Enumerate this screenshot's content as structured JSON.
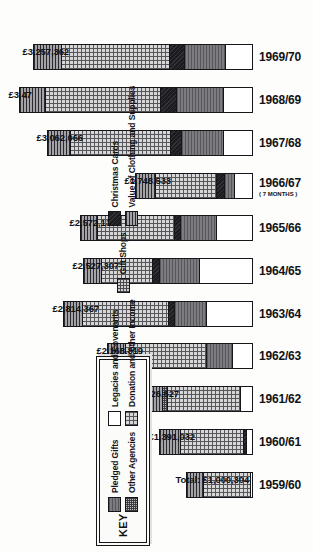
{
  "chart_data": {
    "type": "bar",
    "title": "",
    "xlabel": "",
    "ylabel": "",
    "stacked": true,
    "orientation": "vertical-rotated-90ccw",
    "ylim": [
      0,
      3500000
    ],
    "grid": false,
    "legend_position": "left",
    "categories": [
      "1959/60",
      "1960/61",
      "1961/62",
      "1962/63",
      "1963/64",
      "1964/65",
      "1965/66",
      "1966/67",
      "1967/68",
      "1968/69",
      "1969/70"
    ],
    "total_labels": [
      "Total: £1,000,304",
      "£1,391,032",
      "£1,626,627",
      "£2,168,819",
      "£2,814,367",
      "£2,527,307",
      "£2,572,132",
      "£1,748,533",
      "£3,062,066",
      "£3,47",
      "£3,257,362"
    ],
    "totals": [
      1000304,
      1391032,
      1626627,
      2168819,
      2814367,
      2527307,
      2572132,
      1748533,
      3062066,
      3470000,
      3257362
    ],
    "series": [
      {
        "name": "Legacies and Covenants",
        "key": "legacies",
        "values": [
          60000,
          130000,
          210000,
          330000,
          700000,
          820000,
          560000,
          290000,
          470000,
          470000,
          430000
        ]
      },
      {
        "name": "Pledged Gifts",
        "key": "pledged",
        "values": [
          0,
          0,
          0,
          380000,
          480000,
          600000,
          530000,
          150000,
          620000,
          700000,
          610000
        ]
      },
      {
        "name": "Christmas Cards",
        "key": "xmas",
        "values": [
          0,
          40000,
          0,
          0,
          90000,
          100000,
          90000,
          120000,
          170000,
          230000,
          220000
        ]
      },
      {
        "name": "Donation and other Income",
        "key": "donation",
        "values": [
          700000,
          930000,
          1080000,
          1210000,
          1280000,
          760000,
          1150000,
          900000,
          1480000,
          1700000,
          1600000
        ]
      },
      {
        "name": "Other Agencies",
        "key": "other",
        "values": [
          0,
          0,
          70000,
          0,
          0,
          0,
          0,
          0,
          0,
          0,
          0
        ]
      },
      {
        "name": "Gift Shops",
        "key": "giftshops",
        "values": [
          0,
          0,
          0,
          0,
          0,
          0,
          0,
          0,
          0,
          0,
          0
        ]
      },
      {
        "name": "Value of Clothing and Supplies",
        "key": "clothing",
        "values": [
          240304,
          291032,
          266627,
          248819,
          264367,
          247307,
          242132,
          288533,
          322066,
          370000,
          397362
        ]
      }
    ]
  },
  "legend": {
    "title": "KEY",
    "columns": [
      [
        {
          "label": "Pledged Gifts",
          "swatch": "pledged"
        },
        {
          "label": "Other Agencies",
          "swatch": "other"
        }
      ],
      [
        {
          "label": "Legacies and Covenants",
          "swatch": "legacies"
        },
        {
          "label": "Donation and other Income",
          "swatch": "donation"
        }
      ],
      [
        {
          "label": "Gift Shops",
          "swatch": "giftshops"
        }
      ],
      [
        {
          "label": "Christmas Cards",
          "swatch": "xmas"
        },
        {
          "label": "Value of Clothing and Supplies",
          "swatch": "clothing"
        }
      ]
    ]
  },
  "annotations": {
    "1966/67": "( 7 MONTHS )"
  }
}
